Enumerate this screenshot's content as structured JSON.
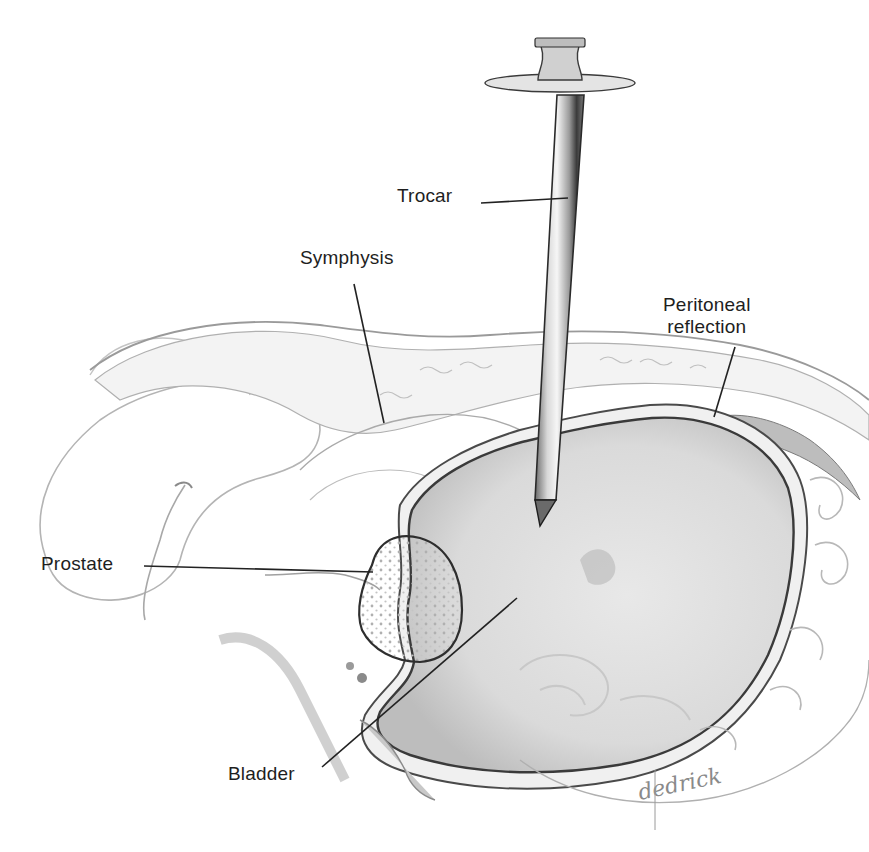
{
  "figure": {
    "width": 869,
    "height": 852,
    "background": "#ffffff",
    "colors": {
      "ink": "#1e1e1e",
      "leader": "#222222",
      "contour": "#9a9a9a",
      "contour_light": "#c4c4c4",
      "bladder_fill": "#dcdcdc",
      "bladder_dark": "#b8b8b8",
      "bladder_wall": "#3a3a3a",
      "prostate_fill": "#f4f4f4",
      "prostate_dots": "#b0b0b0",
      "trocar_body": "#d8d8d8",
      "trocar_shadow": "#4a4a4a",
      "trocar_highlight": "#f6f6f6",
      "peritoneum_fill": "#bdbdbd"
    }
  },
  "labels": [
    {
      "id": "trocar",
      "text": "Trocar",
      "x": 397,
      "y": 185,
      "align": "left",
      "leader": {
        "x1": 481,
        "y1": 203,
        "x2": 568,
        "y2": 198
      }
    },
    {
      "id": "symphysis",
      "text": "Symphysis",
      "x": 300,
      "y": 247,
      "align": "left",
      "leader": {
        "x1": 354,
        "y1": 284,
        "x2": 384,
        "y2": 423
      }
    },
    {
      "id": "peritoneal-reflection",
      "text": "Peritoneal\nreflection",
      "x": 663,
      "y": 294,
      "align": "center",
      "leader": {
        "x1": 735,
        "y1": 347,
        "x2": 714,
        "y2": 417
      }
    },
    {
      "id": "prostate",
      "text": "Prostate",
      "x": 41,
      "y": 553,
      "align": "left",
      "leader": {
        "x1": 144,
        "y1": 566,
        "x2": 373,
        "y2": 572
      }
    },
    {
      "id": "bladder",
      "text": "Bladder",
      "x": 228,
      "y": 763,
      "align": "left",
      "leader": {
        "x1": 322,
        "y1": 767,
        "x2": 517,
        "y2": 598
      }
    }
  ],
  "signature": {
    "text": "dedrick",
    "x": 640,
    "y": 800,
    "color": "#8a8a8a"
  },
  "shapes": {
    "bladder_outer_wall": "M 400 505 C 420 470 470 445 520 430 C 560 420 600 410 650 405 C 720 400 780 430 800 480 C 815 520 805 600 780 660 C 750 720 700 765 620 780 C 540 795 460 790 400 770 C 370 760 355 740 365 715 C 380 690 400 680 405 660 C 400 640 395 620 400 590 C 405 560 395 530 400 505 Z",
    "bladder_lumen": "M 412 510 C 430 478 475 455 522 442 C 565 432 605 422 652 418 C 715 414 770 442 788 488 C 800 528 792 600 768 655 C 740 712 694 752 618 765 C 540 778 465 773 410 755 C 384 746 372 730 380 712 C 393 692 410 684 414 662 C 410 640 404 620 410 592 C 414 562 404 534 412 510 Z",
    "prostate": "M 372 565 C 378 540 398 532 420 538 C 448 546 462 575 462 610 C 462 640 448 660 420 662 C 395 662 372 650 362 630 C 355 610 362 585 372 565 Z",
    "symphysis_band": "M 95 380 C 150 335 260 320 340 340 C 400 355 460 350 530 345 C 600 340 680 345 760 360 C 810 370 850 395 869 415 L 869 440 C 840 420 800 400 750 392 C 690 382 620 380 560 390 C 500 400 440 420 395 430 C 360 438 330 432 300 415 C 250 385 180 375 120 400 Z",
    "abdominal_wall_top": "M 90 370 C 140 330 230 315 320 325 C 380 333 430 340 490 335 C 580 328 660 330 740 345 C 800 357 845 380 869 400",
    "peritoneal_pocket": "M 712 418 C 740 410 780 420 810 440 C 835 458 850 478 860 500 C 840 480 815 462 790 452 C 765 442 735 430 712 418 Z",
    "penis_shaft_outer": "M 45 555 C 30 510 50 460 100 420 C 150 385 220 375 260 380 C 300 386 320 405 320 430 C 318 460 290 470 260 478 C 215 490 190 520 180 560 C 170 590 120 610 80 595 C 60 588 50 575 45 555 Z",
    "penis_glans_upper": "M 90 375 C 110 340 160 330 200 345 C 230 355 245 375 250 395",
    "urethra_curve": "M 185 485 C 175 500 165 520 160 540 C 150 570 140 600 145 620",
    "rectum_outline": "M 520 760 C 560 790 620 810 700 800 C 760 792 820 760 850 720 C 865 700 869 680 869 660",
    "seminal_vesicle": "M 530 760 C 560 770 600 775 640 770"
  },
  "trocar": {
    "shaft": {
      "top_left": [
        557,
        95
      ],
      "top_right": [
        584,
        95
      ],
      "bottom_left": [
        535,
        500
      ],
      "bottom_right": [
        556,
        500
      ]
    },
    "tip": [
      540,
      526
    ],
    "flange": {
      "cx": 560,
      "cy": 83,
      "rx": 75,
      "ry": 9
    },
    "hub": {
      "top_y": 38,
      "bottom_y": 80,
      "top_width": 50,
      "bottom_width": 44
    }
  }
}
